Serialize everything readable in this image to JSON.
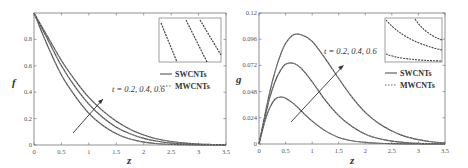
{
  "chart_data": [
    {
      "type": "line",
      "title": "",
      "xlabel": "z",
      "ylabel": "f",
      "xlim": [
        0,
        3.5
      ],
      "ylim": [
        0,
        1
      ],
      "x_ticks": [
        "0",
        "0.5",
        "1",
        "1.5",
        "2",
        "2.5",
        "3",
        "3.5"
      ],
      "y_ticks": [
        "0",
        "0.2",
        "0.4",
        "0.6",
        "0.8"
      ],
      "grid": false,
      "legend": [
        "SWCNTs",
        "MWCNTs"
      ],
      "legend_position": "right-middle",
      "annotation": "t = 0.2, 0.4, 0.6",
      "inset": true,
      "x": [
        0,
        0.25,
        0.5,
        0.75,
        1.0,
        1.25,
        1.5,
        1.75,
        2.0,
        2.25,
        2.5,
        2.75,
        3.0,
        3.25,
        3.5
      ],
      "series": [
        {
          "name": "t = 0.2",
          "style": "SWCNTs solid / MWCNTs dashed",
          "values": [
            1.0,
            0.75,
            0.53,
            0.37,
            0.24,
            0.15,
            0.085,
            0.045,
            0.022,
            0.01,
            0.005,
            0.002,
            0.001,
            0.0,
            0.0
          ]
        },
        {
          "name": "t = 0.4",
          "style": "SWCNTs solid / MWCNTs dashed",
          "values": [
            1.0,
            0.8,
            0.6,
            0.44,
            0.31,
            0.21,
            0.135,
            0.085,
            0.05,
            0.028,
            0.015,
            0.008,
            0.004,
            0.002,
            0.001
          ]
        },
        {
          "name": "t = 0.6",
          "style": "SWCNTs solid / MWCNTs dashed",
          "values": [
            1.0,
            0.82,
            0.64,
            0.49,
            0.36,
            0.26,
            0.18,
            0.12,
            0.075,
            0.045,
            0.026,
            0.014,
            0.007,
            0.004,
            0.002
          ]
        }
      ]
    },
    {
      "type": "line",
      "title": "",
      "xlabel": "z",
      "ylabel": "g",
      "xlim": [
        0,
        3.5
      ],
      "ylim": [
        0,
        0.12
      ],
      "x_ticks": [
        "0",
        "0.5",
        "1",
        "1.5",
        "2",
        "2.5",
        "3",
        "3.5"
      ],
      "y_ticks": [
        "0",
        "0.024",
        "0.048",
        "0.072",
        "0.096",
        "0.12"
      ],
      "grid": false,
      "legend": [
        "SWCNTs",
        "MWCNTs"
      ],
      "legend_position": "right-middle",
      "annotation": "t = 0.2, 0.4, 0.6",
      "inset": true,
      "x": [
        0,
        0.1,
        0.2,
        0.3,
        0.4,
        0.5,
        0.65,
        0.8,
        1.0,
        1.25,
        1.5,
        1.75,
        2.0,
        2.25,
        2.5,
        2.75,
        3.0,
        3.25,
        3.5
      ],
      "series": [
        {
          "name": "t = 0.2",
          "values": [
            0,
            0.019,
            0.033,
            0.041,
            0.043,
            0.042,
            0.037,
            0.03,
            0.021,
            0.012,
            0.006,
            0.003,
            0.0015,
            0.0007,
            0.0003,
            0.0001,
            0.0,
            0.0,
            0.0
          ]
        },
        {
          "name": "t = 0.4",
          "values": [
            0,
            0.022,
            0.042,
            0.057,
            0.067,
            0.073,
            0.074,
            0.069,
            0.057,
            0.04,
            0.026,
            0.016,
            0.009,
            0.005,
            0.0026,
            0.0013,
            0.0006,
            0.0003,
            0.0001
          ]
        },
        {
          "name": "t = 0.6",
          "values": [
            0,
            0.024,
            0.047,
            0.066,
            0.081,
            0.092,
            0.1,
            0.1,
            0.094,
            0.078,
            0.06,
            0.043,
            0.029,
            0.019,
            0.012,
            0.007,
            0.004,
            0.002,
            0.001
          ]
        }
      ]
    }
  ],
  "panels": [
    {
      "ylabel": "f",
      "xlabel": "z",
      "annotation": "t = 0.2, 0.4, 0.6",
      "legend_solid": "SWCNTs",
      "legend_dashed": "MWCNTs"
    },
    {
      "ylabel": "g",
      "xlabel": "z",
      "annotation": "t = 0.2, 0.4, 0.6",
      "legend_solid": "SWCNTs",
      "legend_dashed": "MWCNTs"
    }
  ],
  "colors": {
    "solid": "#4a4a4a",
    "dashed": "#8a8a8a",
    "frame": "#777777"
  }
}
